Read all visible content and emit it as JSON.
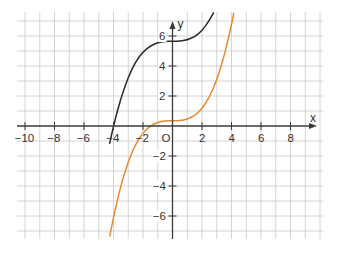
{
  "chart_data": {
    "type": "line",
    "title": "",
    "xlabel": "x",
    "ylabel": "y",
    "origin_label": "O",
    "xlim": [
      -10.5,
      10.2
    ],
    "ylim": [
      -7.5,
      7.6
    ],
    "grid": true,
    "grid_step": 1,
    "x_ticks": [
      -10,
      -8,
      -6,
      -4,
      -2,
      2,
      4,
      6,
      8
    ],
    "x_tick_labels": [
      "−10",
      "−8",
      "−6",
      "−4",
      "−2",
      "2",
      "4",
      "6",
      "8"
    ],
    "y_ticks": [
      -6,
      -4,
      -2,
      2,
      4,
      6
    ],
    "y_tick_labels": [
      "−6",
      "−4",
      "−2",
      "2",
      "4",
      "6"
    ],
    "series": [
      {
        "name": "black curve",
        "color": "#2b2b2b",
        "formula_approx": "0.088x^3 + 5.65",
        "x": [
          -4.26,
          -4.0,
          -3.5,
          -3.0,
          -2.5,
          -2.0,
          -1.5,
          -1.0,
          -0.5,
          0.0,
          0.5,
          1.0,
          1.5,
          2.0,
          2.5,
          2.78
        ],
        "y": [
          -1.15,
          0.02,
          1.88,
          3.27,
          4.28,
          4.95,
          5.35,
          5.56,
          5.64,
          5.65,
          5.66,
          5.74,
          5.95,
          6.35,
          7.03,
          7.54
        ]
      },
      {
        "name": "orange curve",
        "color": "#e8892f",
        "formula_approx": "0.1x^3 + 0.35",
        "x": [
          -4.25,
          -4.0,
          -3.5,
          -3.0,
          -2.5,
          -2.0,
          -1.5,
          -1.0,
          -0.5,
          0.0,
          0.5,
          1.0,
          1.5,
          2.0,
          2.5,
          3.0,
          3.5,
          4.0,
          4.15
        ],
        "y": [
          -7.33,
          -6.05,
          -3.94,
          -2.35,
          -1.21,
          -0.45,
          0.01,
          0.25,
          0.34,
          0.35,
          0.36,
          0.45,
          0.69,
          1.15,
          1.91,
          3.05,
          4.64,
          6.75,
          7.5
        ]
      }
    ]
  },
  "layout": {
    "px_per_unit_x": 14.75,
    "px_per_unit_y": 15,
    "origin_px": [
      172.5,
      126
    ],
    "plot_bounds_px": {
      "left": 17,
      "right": 323,
      "top": 12,
      "bottom": 239
    }
  }
}
